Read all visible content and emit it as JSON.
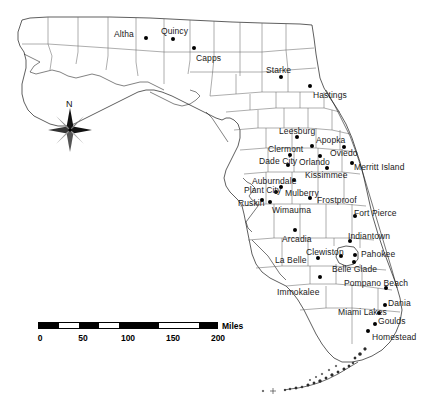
{
  "map": {
    "title": "Florida",
    "background_color": "#ffffff",
    "outline_color": "#1a1a1a",
    "county_line_color": "#555555",
    "dot_color": "#000000",
    "label_color": "#1a1a1a"
  },
  "compass": {
    "north_label": "N",
    "name": "compass-rose"
  },
  "scale": {
    "units_label": "Miles",
    "tick_labels": [
      "0",
      "50",
      "100",
      "150",
      "200"
    ],
    "segments": [
      "black",
      "white",
      "black",
      "white",
      "black",
      "white",
      "black"
    ],
    "max_miles": 200
  },
  "cities": [
    {
      "name": "Altha",
      "label_x": 114,
      "label_y": 30,
      "dot_x": 146,
      "dot_y": 38
    },
    {
      "name": "Quincy",
      "label_x": 161,
      "label_y": 27,
      "dot_x": 173,
      "dot_y": 39
    },
    {
      "name": "Capps",
      "label_x": 196,
      "label_y": 54,
      "dot_x": 194,
      "dot_y": 48
    },
    {
      "name": "Starke",
      "label_x": 266,
      "label_y": 66,
      "dot_x": 281,
      "dot_y": 77
    },
    {
      "name": "Hastings",
      "label_x": 313,
      "label_y": 91,
      "dot_x": 310,
      "dot_y": 86
    },
    {
      "name": "Leesburg",
      "label_x": 279,
      "label_y": 127,
      "dot_x": 297,
      "dot_y": 137
    },
    {
      "name": "Apopka",
      "label_x": 316,
      "label_y": 136,
      "dot_x": 312,
      "dot_y": 146
    },
    {
      "name": "Clermont",
      "label_x": 268,
      "label_y": 145,
      "dot_x": 290,
      "dot_y": 155
    },
    {
      "name": "Oviedo",
      "label_x": 330,
      "label_y": 149,
      "dot_x": 344,
      "dot_y": 147
    },
    {
      "name": "Orlando",
      "label_x": 299,
      "label_y": 158,
      "dot_x": 320,
      "dot_y": 156
    },
    {
      "name": "Dade City",
      "label_x": 259,
      "label_y": 157,
      "dot_x": 288,
      "dot_y": 165
    },
    {
      "name": "Kissimmee",
      "label_x": 305,
      "label_y": 171,
      "dot_x": 327,
      "dot_y": 168
    },
    {
      "name": "Merritt Island",
      "label_x": 354,
      "label_y": 168,
      "dot_x": 352,
      "dot_y": 163
    },
    {
      "name": "Auburndale",
      "label_x": 252,
      "label_y": 177,
      "dot_x": 294,
      "dot_y": 180
    },
    {
      "name": "Plant City",
      "label_x": 244,
      "label_y": 186,
      "dot_x": 281,
      "dot_y": 187
    },
    {
      "name": "Mulberry",
      "label_x": 285,
      "label_y": 189,
      "dot_x": 276,
      "dot_y": 192
    },
    {
      "name": "Frostproof",
      "label_x": 317,
      "label_y": 199,
      "dot_x": 310,
      "dot_y": 198
    },
    {
      "name": "Ruskin",
      "label_x": 238,
      "label_y": 199,
      "dot_x": 262,
      "dot_y": 200
    },
    {
      "name": "Wimauma",
      "label_x": 272,
      "label_y": 208,
      "dot_x": 270,
      "dot_y": 202
    },
    {
      "name": "Fort Pierce",
      "label_x": 354,
      "label_y": 209,
      "dot_x": 355,
      "dot_y": 216
    },
    {
      "name": "Arcadia",
      "label_x": 282,
      "label_y": 237,
      "dot_x": 295,
      "dot_y": 230
    },
    {
      "name": "Indiantown",
      "label_x": 350,
      "label_y": 232,
      "dot_x": 350,
      "dot_y": 241
    },
    {
      "name": "Clewiston",
      "label_x": 309,
      "label_y": 249,
      "dot_x": 341,
      "dot_y": 256
    },
    {
      "name": "Pahokee",
      "label_x": 363,
      "label_y": 250,
      "dot_x": 355,
      "dot_y": 255
    },
    {
      "name": "La Belle",
      "label_x": 275,
      "label_y": 257,
      "dot_x": 318,
      "dot_y": 258
    },
    {
      "name": "Belle Glade",
      "label_x": 336,
      "label_y": 266,
      "dot_x": 354,
      "dot_y": 262
    },
    {
      "name": "Pompano Beach",
      "label_x": 346,
      "label_y": 281,
      "dot_x": 386,
      "dot_y": 288
    },
    {
      "name": "Immokalee",
      "label_x": 277,
      "label_y": 288,
      "dot_x": 320,
      "dot_y": 277
    },
    {
      "name": "Dania",
      "label_x": 386,
      "label_y": 300,
      "dot_x": 385,
      "dot_y": 305
    },
    {
      "name": "Miami Lakes",
      "label_x": 341,
      "label_y": 310,
      "dot_x": 379,
      "dot_y": 313
    },
    {
      "name": "Goulds",
      "label_x": 377,
      "label_y": 319,
      "dot_x": 375,
      "dot_y": 324
    },
    {
      "name": "Homestead",
      "label_x": 372,
      "label_y": 335,
      "dot_x": 368,
      "dot_y": 331
    }
  ]
}
